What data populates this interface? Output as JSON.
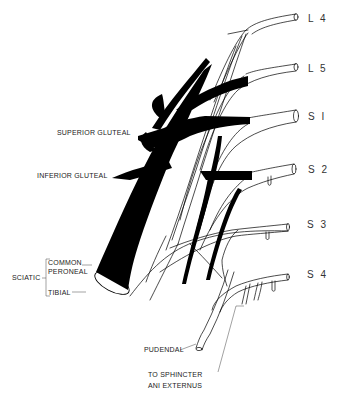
{
  "diagram": {
    "type": "anatomical illustration",
    "colors": {
      "background": "#ffffff",
      "ink": "#000000",
      "text": "#222222"
    }
  },
  "roots": {
    "l4": "L 4",
    "l5": "L 5",
    "s1": "S I",
    "s2": "S 2",
    "s3": "S 3",
    "s4": "S 4"
  },
  "labels": {
    "superior_gluteal": "SUPERIOR GLUTEAL",
    "inferior_gluteal": "INFERIOR GLUTEAL",
    "sciatic": "SCIATIC",
    "common_peroneal_1": "COMMON",
    "common_peroneal_2": "PERONEAL",
    "tibial": "TIBIAL",
    "pudendal": "PUDENDAL",
    "sphincter_1": "TO SPHINCTER",
    "sphincter_2": "ANI EXTERNUS"
  }
}
